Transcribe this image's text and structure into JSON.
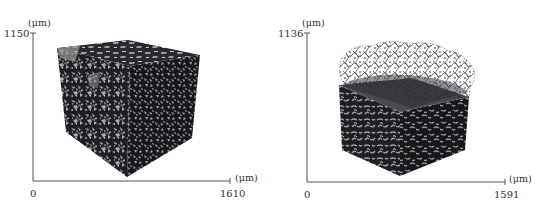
{
  "figure": {
    "panels": [
      {
        "id": "left",
        "description": "3D volume rendering of porous cube sample (full cube)",
        "y_axis": {
          "max_label": "1150",
          "unit": "(μm)"
        },
        "x_axis": {
          "origin_label": "0",
          "max_label": "1610",
          "unit": "(μm)"
        }
      },
      {
        "id": "right",
        "description": "3D volume rendering of porous block with fibrous network on top",
        "y_axis": {
          "max_label": "1136",
          "unit": "(μm)"
        },
        "x_axis": {
          "origin_label": "0",
          "max_label": "1591",
          "unit": "(μm)"
        }
      }
    ],
    "colors": {
      "axis": "#555555",
      "cube_dark": "#1e1e22",
      "cube_light": "#b8b8b8",
      "fiber": "#5a5a5a"
    }
  }
}
